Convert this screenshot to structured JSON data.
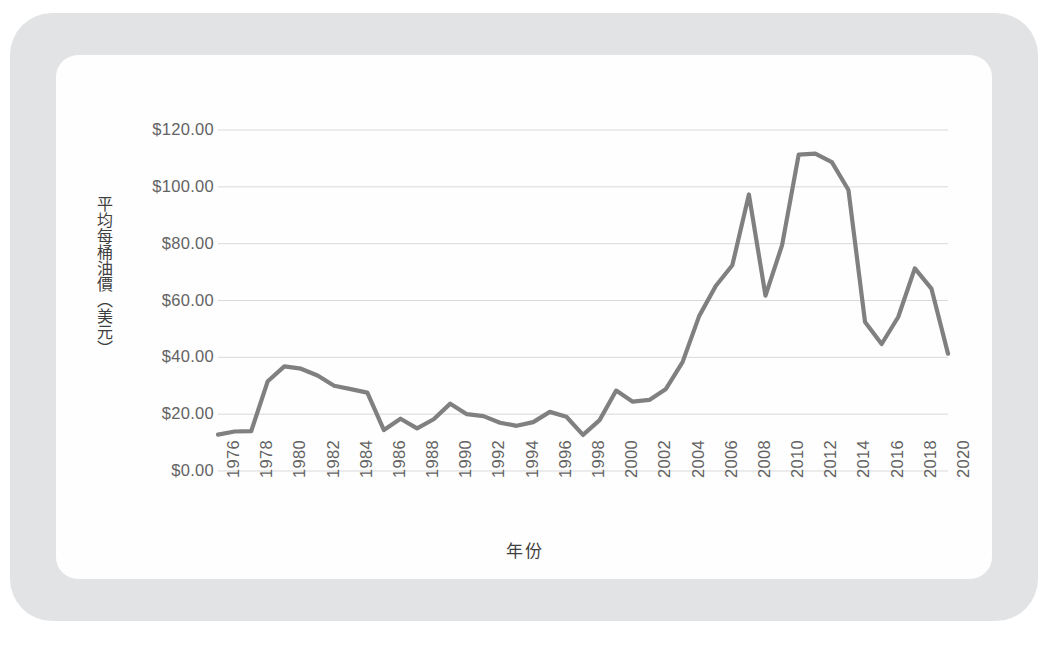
{
  "chart_data": {
    "type": "line",
    "title": "",
    "xlabel": "年份",
    "ylabel": "平均每桶油價（美元）",
    "ylim": [
      0,
      120
    ],
    "ytick_values": [
      120,
      100,
      80,
      60,
      40,
      20,
      0
    ],
    "ytick_labels": [
      "$120.00",
      "$100.00",
      "$80.00",
      "$60.00",
      "$40.00",
      "$20.00",
      "$0.00"
    ],
    "xlim": [
      1976,
      2020
    ],
    "xtick_labels": [
      "1976",
      "1978",
      "1980",
      "1982",
      "1984",
      "1986",
      "1988",
      "1990",
      "1992",
      "1994",
      "1996",
      "1998",
      "2000",
      "2002",
      "2004",
      "2006",
      "2008",
      "2010",
      "2012",
      "2014",
      "2016",
      "2018",
      "2020"
    ],
    "grid": "horizontal",
    "legend": "none",
    "series_color": "#808080",
    "gridline_color": "#d9d9d9",
    "x": [
      1976,
      1977,
      1978,
      1979,
      1980,
      1981,
      1982,
      1983,
      1984,
      1985,
      1986,
      1987,
      1988,
      1989,
      1990,
      1991,
      1992,
      1993,
      1994,
      1995,
      1996,
      1997,
      1998,
      1999,
      2000,
      2001,
      2002,
      2003,
      2004,
      2005,
      2006,
      2007,
      2008,
      2009,
      2010,
      2011,
      2012,
      2013,
      2014,
      2015,
      2016,
      2017,
      2018,
      2019,
      2020
    ],
    "values": [
      12.8,
      13.9,
      14.0,
      31.6,
      36.8,
      36.0,
      33.6,
      30.0,
      28.8,
      27.6,
      14.4,
      18.4,
      15.0,
      18.2,
      23.7,
      20.0,
      19.3,
      17.0,
      15.9,
      17.2,
      20.8,
      19.1,
      12.7,
      17.9,
      28.3,
      24.4,
      25.0,
      28.9,
      38.3,
      54.5,
      65.1,
      72.4,
      97.3,
      61.7,
      79.5,
      111.3,
      111.7,
      108.7,
      98.9,
      52.4,
      44.7,
      54.2,
      71.3,
      64.2,
      41.3
    ],
    "annotations": []
  },
  "axes": {
    "y_title_text": "平均每桶油價（美元）",
    "x_title_text": "年份"
  }
}
